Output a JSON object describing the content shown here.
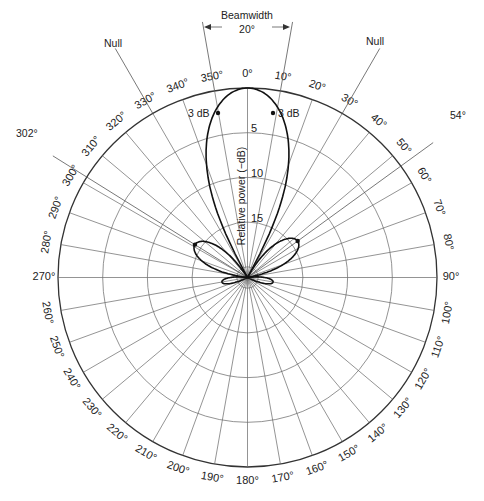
{
  "diagram": {
    "type": "polar-antenna-radiation-pattern",
    "center": [
      247.5,
      277.5
    ],
    "outer_radius": 189.5,
    "angle_labels": [
      "0°",
      "10°",
      "20°",
      "30°",
      "40°",
      "50°",
      "60°",
      "70°",
      "80°",
      "90°",
      "100°",
      "110°",
      "120°",
      "130°",
      "140°",
      "150°",
      "160°",
      "170°",
      "180°",
      "190°",
      "200°",
      "210°",
      "220°",
      "230°",
      "240°",
      "250°",
      "260°",
      "270°",
      "280°",
      "290°",
      "300°",
      "310°",
      "320°",
      "330°",
      "340°",
      "350°"
    ],
    "ring_labels": [
      "5",
      "10",
      "15"
    ],
    "ring_values_db": [
      0,
      5,
      10,
      15,
      20
    ],
    "radial_axis_label": "Relative power (−dB)",
    "annotations": {
      "beamwidth_title": "Beamwidth",
      "beamwidth_value": "20°",
      "three_db_left": "3 dB",
      "three_db_right": "3 dB",
      "null_left": "Null",
      "null_right": "Null",
      "side_lobe_left_angle": "302°",
      "side_lobe_right_angle": "54°"
    },
    "pattern": {
      "main_lobe": {
        "direction_deg": 0,
        "peak_db": 0,
        "half_power_beamwidth_deg": 20
      },
      "nulls_deg": [
        330,
        30
      ],
      "side_lobes": [
        {
          "direction_deg": 302,
          "level_db": -14
        },
        {
          "direction_deg": 54,
          "level_db": -14
        }
      ],
      "back_lobe": {
        "direction_deg": 180,
        "level_db": -19
      }
    }
  },
  "caption_fragment": ""
}
